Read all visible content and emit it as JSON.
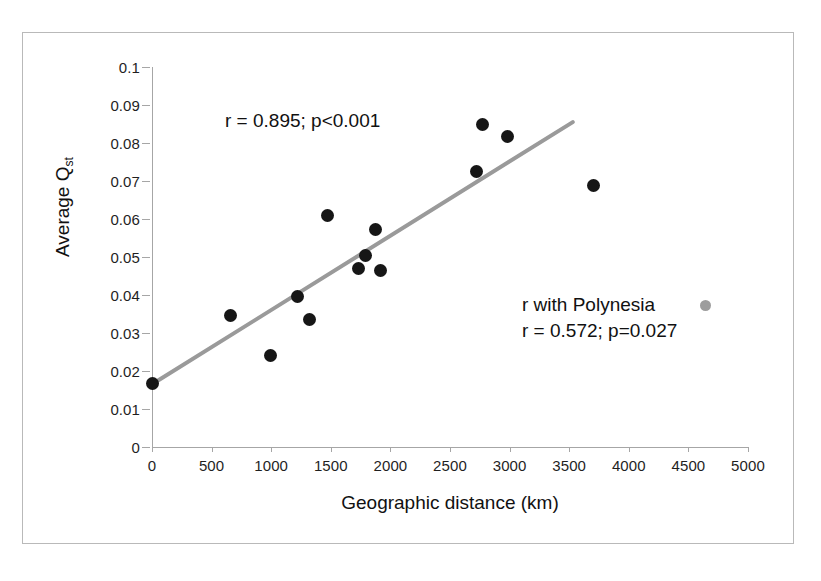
{
  "figure": {
    "background_color": "#ffffff",
    "frame_color": "#b9b9b9",
    "point_color": "#161616",
    "trendline_color": "#9a9a9a",
    "polynesia_marker_color": "#9d9d9d"
  },
  "annotations": {
    "primary": "r = 0.895; p<0.001",
    "secondary_line1": "r with Polynesia",
    "secondary_line2": "r = 0.572; p=0.027",
    "polynesia_marker_name": "gray-dot-marker"
  },
  "chart_data": {
    "type": "scatter",
    "title": "",
    "xlabel": "Geographic distance (km)",
    "ylabel": "Average Qst",
    "ylabel_base": "Average Q",
    "ylabel_sub": "st",
    "xlim": [
      0,
      5000
    ],
    "ylim": [
      0,
      0.1
    ],
    "xticks": [
      0,
      500,
      1000,
      1500,
      2000,
      2500,
      3000,
      3500,
      4000,
      4500,
      5000
    ],
    "xtick_labels": [
      "0",
      "500",
      "1000",
      "1500",
      "2000",
      "2500",
      "3000",
      "3500",
      "4000",
      "4500",
      "5000"
    ],
    "yticks": [
      0,
      0.01,
      0.02,
      0.03,
      0.04,
      0.05,
      0.06,
      0.07,
      0.08,
      0.09,
      0.1
    ],
    "ytick_labels": [
      "0",
      "0.01",
      "0.02",
      "0.03",
      "0.04",
      "0.05",
      "0.06",
      "0.07",
      "0.08",
      "0.09",
      "0.1"
    ],
    "grid": false,
    "legend": false,
    "points": [
      {
        "x": 0,
        "y": 0.0167
      },
      {
        "x": 655,
        "y": 0.0345
      },
      {
        "x": 990,
        "y": 0.0242
      },
      {
        "x": 1220,
        "y": 0.0397
      },
      {
        "x": 1325,
        "y": 0.0335
      },
      {
        "x": 1470,
        "y": 0.0609
      },
      {
        "x": 1730,
        "y": 0.047
      },
      {
        "x": 1795,
        "y": 0.0503
      },
      {
        "x": 1875,
        "y": 0.0573
      },
      {
        "x": 1915,
        "y": 0.0464
      },
      {
        "x": 2725,
        "y": 0.0726
      },
      {
        "x": 2775,
        "y": 0.0848
      },
      {
        "x": 2980,
        "y": 0.0818
      },
      {
        "x": 3705,
        "y": 0.0688
      }
    ],
    "trendline": {
      "x_start": 0,
      "y_start": 0.0165,
      "x_end": 3530,
      "y_end": 0.0855
    },
    "annotations": [
      {
        "text": "r = 0.895; p<0.001",
        "x": 900,
        "y": 0.088
      },
      {
        "text": "r with Polynesia",
        "x": 3400,
        "y": 0.0385
      },
      {
        "text": "r = 0.572; p=0.027",
        "x": 3400,
        "y": 0.0335
      }
    ]
  }
}
